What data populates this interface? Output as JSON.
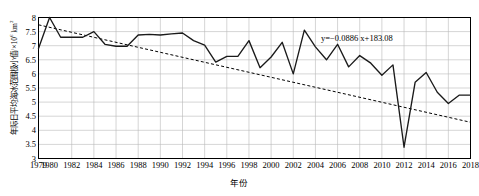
{
  "chart_data": {
    "type": "line",
    "title": "",
    "xlabel": "年份",
    "ylabel": "年际日平均海冰范围极小值/×10⁶ km²",
    "ylabel_text": "年际日平均海冰范围极小值/×10",
    "ylabel_exp": "6",
    "ylabel_unit": " km",
    "ylabel_unit_exp": "2",
    "xlim": [
      1979,
      2018
    ],
    "ylim": [
      3,
      8
    ],
    "grid": true,
    "legend": null,
    "annotation": "y=−0.0886 x+183.08",
    "annotation_plain": "y=-0.0886x+183.08",
    "yticks": [
      3,
      3.5,
      4,
      4.5,
      5,
      5.5,
      6,
      6.5,
      7,
      7.5,
      8
    ],
    "ytick_labels": [
      "3",
      "3.5",
      "4",
      "4.5",
      "5",
      "5.5",
      "6",
      "6.5",
      "7",
      "7.5",
      "8"
    ],
    "xticks": [
      1979,
      1980,
      1982,
      1984,
      1986,
      1988,
      1990,
      1992,
      1994,
      1996,
      1998,
      2000,
      2002,
      2004,
      2006,
      2008,
      2010,
      2012,
      2014,
      2016,
      2018
    ],
    "xtick_labels": [
      "1979",
      "1980",
      "1982",
      "1984",
      "1986",
      "1988",
      "1990",
      "1992",
      "1994",
      "1996",
      "1998",
      "2000",
      "2002",
      "2004",
      "2006",
      "2008",
      "2010",
      "2012",
      "2014",
      "2016",
      "2018"
    ],
    "series": [
      {
        "name": "年际日平均海冰范围极小值",
        "style": "solid",
        "color": "#000000",
        "x": [
          1979,
          1980,
          1981,
          1982,
          1983,
          1984,
          1985,
          1986,
          1987,
          1988,
          1989,
          1990,
          1991,
          1992,
          1993,
          1994,
          1995,
          1996,
          1997,
          1998,
          1999,
          2000,
          2001,
          2002,
          2003,
          2004,
          2005,
          2006,
          2007,
          2008,
          2009,
          2010,
          2011,
          2012,
          2013,
          2014,
          2015,
          2016,
          2017,
          2018
        ],
        "values": [
          6.9,
          8.0,
          7.3,
          7.3,
          7.3,
          7.5,
          7.05,
          6.98,
          6.98,
          7.38,
          7.4,
          7.38,
          7.42,
          7.45,
          7.18,
          7.02,
          6.42,
          6.62,
          6.62,
          7.18,
          6.22,
          6.6,
          7.12,
          6.0,
          7.55,
          6.96,
          6.5,
          6.62,
          6.8,
          7.16,
          6.28,
          6.32,
          6.48,
          7.0,
          6.48,
          6.9,
          6.1,
          5.1,
          5.38,
          5.2
        ],
        "values_right": [
          7.2,
          7.4,
          6.95,
          6.6,
          5.3,
          6.3,
          6.7,
          5.95,
          6.05,
          5.95,
          6.0
        ]
      },
      {
        "name": "线性趋势线",
        "style": "dashed",
        "color": "#000000",
        "equation_slope": -0.0886,
        "equation_intercept": 183.08,
        "x": [
          1979,
          2018
        ],
        "values": [
          7.76,
          4.3
        ]
      }
    ],
    "data_points": [
      {
        "year": 1979,
        "value": 6.9
      },
      {
        "year": 1980,
        "value": 8.0
      },
      {
        "year": 1981,
        "value": 7.3
      },
      {
        "year": 1982,
        "value": 7.3
      },
      {
        "year": 1983,
        "value": 7.3
      },
      {
        "year": 1984,
        "value": 7.5
      },
      {
        "year": 1985,
        "value": 7.05
      },
      {
        "year": 1986,
        "value": 6.98
      },
      {
        "year": 1987,
        "value": 6.98
      },
      {
        "year": 1988,
        "value": 7.38
      },
      {
        "year": 1989,
        "value": 7.4
      },
      {
        "year": 1990,
        "value": 7.38
      },
      {
        "year": 1991,
        "value": 7.42
      },
      {
        "year": 1992,
        "value": 7.45
      },
      {
        "year": 1993,
        "value": 7.18
      },
      {
        "year": 1994,
        "value": 7.02
      },
      {
        "year": 1995,
        "value": 6.42
      },
      {
        "year": 1996,
        "value": 6.62
      },
      {
        "year": 1997,
        "value": 6.62
      },
      {
        "year": 1998,
        "value": 7.18
      },
      {
        "year": 1999,
        "value": 6.22
      },
      {
        "year": 2000,
        "value": 6.6
      },
      {
        "year": 2001,
        "value": 7.12
      },
      {
        "year": 2002,
        "value": 6.0
      },
      {
        "year": 2003,
        "value": 7.55
      },
      {
        "year": 2004,
        "value": 6.96
      },
      {
        "year": 2005,
        "value": 6.5
      },
      {
        "year": 2006,
        "value": 7.05
      },
      {
        "year": 2007,
        "value": 6.25
      },
      {
        "year": 2008,
        "value": 6.65
      },
      {
        "year": 2009,
        "value": 6.38
      },
      {
        "year": 2010,
        "value": 5.95
      },
      {
        "year": 2011,
        "value": 6.32
      },
      {
        "year": 2012,
        "value": 3.4
      },
      {
        "year": 2013,
        "value": 5.7
      },
      {
        "year": 2014,
        "value": 6.05
      },
      {
        "year": 2015,
        "value": 5.35
      },
      {
        "year": 2016,
        "value": 4.95
      },
      {
        "year": 2017,
        "value": 5.25
      },
      {
        "year": 2018,
        "value": 5.25
      }
    ]
  },
  "axes": {
    "x_title": "年份",
    "y_title_main": "年际日平均海冰范围极小值/×10",
    "y_title_sup1": "6",
    "y_title_mid": " km",
    "y_title_sup2": "2"
  },
  "annotation": {
    "trend_equation": "y=−0.0886 x+183.08"
  }
}
